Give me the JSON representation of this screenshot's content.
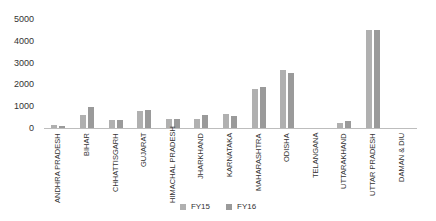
{
  "chart_data": {
    "type": "bar",
    "title": "",
    "xlabel": "",
    "ylabel": "",
    "ylim": [
      0,
      5000
    ],
    "yticks": [
      0,
      1000,
      2000,
      3000,
      4000,
      5000
    ],
    "grid": false,
    "legend_position": "bottom",
    "categories": [
      "ANDHRA PRADESH",
      "BIHAR",
      "CHHATTISGARH",
      "GUJARAT",
      "HIMACHAL PRADESH",
      "JHARKHAND",
      "KARNATAKA",
      "MAHARASHTRA",
      "ODISHA",
      "TELANGANA",
      "UTTARAKHAND",
      "UTTAR PRADESH",
      "DAMAN & DIU"
    ],
    "series": [
      {
        "name": "FY15",
        "color": "#b0b0b0",
        "values": [
          150,
          610,
          350,
          770,
          400,
          400,
          630,
          1790,
          2660,
          0,
          230,
          4500,
          0
        ]
      },
      {
        "name": "FY16",
        "color": "#9a9a9a",
        "values": [
          80,
          950,
          385,
          840,
          400,
          600,
          540,
          1880,
          2530,
          0,
          320,
          4500,
          0
        ]
      }
    ]
  },
  "legend": {
    "items": [
      {
        "label": "FY15",
        "color": "#b0b0b0"
      },
      {
        "label": "FY16",
        "color": "#9a9a9a"
      }
    ]
  }
}
